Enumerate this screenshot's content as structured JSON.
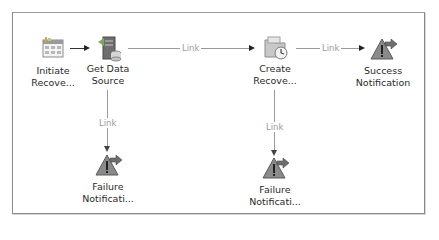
{
  "diagram": {
    "nodes": [
      {
        "id": "initiate",
        "label": "Initiate Recove...",
        "line1": "Initiate",
        "line2": "Recove...",
        "icon": "calendar-icon"
      },
      {
        "id": "get-data",
        "label": "Get Data Source",
        "line1": "Get Data",
        "line2": "Source",
        "icon": "server-database-icon"
      },
      {
        "id": "create",
        "label": "Create Recove...",
        "line1": "Create",
        "line2": "Recove...",
        "icon": "folder-clock-icon"
      },
      {
        "id": "success",
        "label": "Success Notification",
        "line1": "Success",
        "line2": "Notification",
        "icon": "warning-forward-icon"
      },
      {
        "id": "failure1",
        "label": "Failure Notificati...",
        "line1": "Failure",
        "line2": "Notificati...",
        "icon": "warning-forward-icon"
      },
      {
        "id": "failure2",
        "label": "Failure Notificati...",
        "line1": "Failure",
        "line2": "Notificati...",
        "icon": "warning-forward-icon"
      }
    ],
    "edges": [
      {
        "from": "initiate",
        "to": "get-data",
        "label": ""
      },
      {
        "from": "get-data",
        "to": "create",
        "label": "Link"
      },
      {
        "from": "create",
        "to": "success",
        "label": "Link"
      },
      {
        "from": "get-data",
        "to": "failure1",
        "label": "Link"
      },
      {
        "from": "create",
        "to": "failure2",
        "label": "Link"
      }
    ],
    "colors": {
      "frame": "#8a8a8a",
      "connector": "#9a9a9a",
      "arrowhead": "#222222",
      "link_label": "#9a9a9a"
    }
  }
}
